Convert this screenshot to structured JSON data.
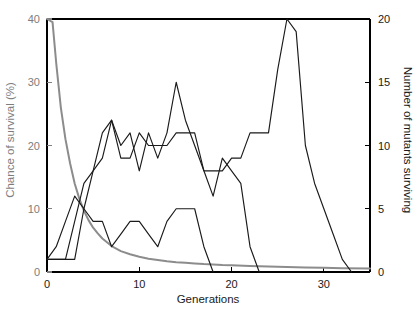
{
  "chart_data": {
    "type": "line",
    "title": "",
    "xlabel": "Generations",
    "ylabel": "Chance of survival (%)",
    "ylabel_right": "Number of mutants surviving",
    "xlim": [
      0,
      35
    ],
    "ylim": [
      0,
      40
    ],
    "ylim_right": [
      0,
      20
    ],
    "xticks": [
      0,
      10,
      20,
      30
    ],
    "xtick_labels": [
      "0",
      "10",
      "20",
      "30"
    ],
    "yticks": [
      0,
      10,
      20,
      30,
      40
    ],
    "ytick_labels": [
      "0",
      "10",
      "20",
      "30",
      "40"
    ],
    "yticks_right": [
      0,
      5,
      10,
      15,
      20
    ],
    "ytick_labels_right": [
      "0",
      "5",
      "10",
      "15",
      "20"
    ],
    "grid": false,
    "legend": "none",
    "colors": {
      "survival_curve": "#8c8c8c",
      "mutant_curves": "#1a1a1a",
      "axis": "#000000",
      "left_axis_text": "#7d7d7d",
      "right_axis_text": "#1a1a1a",
      "background": "#ffffff"
    },
    "series": [
      {
        "name": "Chance of survival (%)",
        "axis": "left",
        "color": "#8c8c8c",
        "x": [
          0,
          0.6,
          1,
          1.5,
          2,
          2.5,
          3,
          3.5,
          4,
          4.5,
          5,
          5.5,
          6,
          7,
          8,
          9,
          10,
          11,
          12,
          13,
          14,
          15,
          16,
          17,
          18,
          19,
          20,
          22,
          24,
          26,
          28,
          30,
          32,
          35
        ],
        "values": [
          40,
          39.5,
          33,
          26,
          21,
          17.2,
          14,
          11.6,
          9.7,
          8.2,
          7,
          6.1,
          5.3,
          4.1,
          3.3,
          2.8,
          2.4,
          2.1,
          1.9,
          1.7,
          1.55,
          1.45,
          1.35,
          1.25,
          1.2,
          1.1,
          1.05,
          0.95,
          0.85,
          0.8,
          0.72,
          0.66,
          0.6,
          0.55
        ]
      },
      {
        "name": "Mutant line A",
        "axis": "right",
        "color": "#1a1a1a",
        "x": [
          0,
          1,
          2,
          3,
          4,
          5,
          6,
          7,
          8,
          9,
          10,
          11,
          12,
          13,
          14,
          15,
          16,
          17,
          18,
          19,
          20,
          21,
          22,
          23,
          24,
          25,
          26,
          27,
          28,
          29,
          30,
          31,
          32,
          33
        ],
        "values": [
          1,
          1,
          1,
          4,
          7,
          8,
          11,
          12,
          9,
          9,
          11,
          10,
          10,
          10,
          11,
          11,
          11,
          8,
          8,
          8,
          9,
          9,
          11,
          11,
          11,
          16,
          20,
          19,
          10,
          7,
          5,
          3,
          1,
          0
        ]
      },
      {
        "name": "Mutant line B",
        "axis": "right",
        "color": "#1a1a1a",
        "x": [
          0,
          1,
          2,
          3,
          4,
          5,
          6,
          7,
          8,
          9,
          10,
          11,
          12,
          13,
          14,
          15,
          16,
          17,
          18,
          19,
          20,
          21,
          22,
          23
        ],
        "values": [
          1,
          1,
          1,
          1,
          5,
          8,
          9,
          12,
          10,
          11,
          8,
          11,
          9,
          11,
          15,
          12,
          10,
          8,
          6,
          9,
          8,
          7,
          2,
          0
        ]
      },
      {
        "name": "Mutant line C",
        "axis": "right",
        "color": "#1a1a1a",
        "x": [
          0,
          1,
          2,
          3,
          4,
          5,
          6,
          7,
          8,
          9,
          10,
          11,
          12,
          13,
          14,
          15,
          16,
          17,
          18
        ],
        "values": [
          1,
          2,
          4,
          6,
          5,
          4,
          4,
          2,
          3,
          4,
          4,
          3,
          2,
          4,
          5,
          5,
          5,
          2,
          0
        ]
      }
    ]
  },
  "axes": {
    "x_title": "Generations",
    "y_left_title": "Chance of survival (%)",
    "y_right_title": "Number of mutants surviving"
  }
}
